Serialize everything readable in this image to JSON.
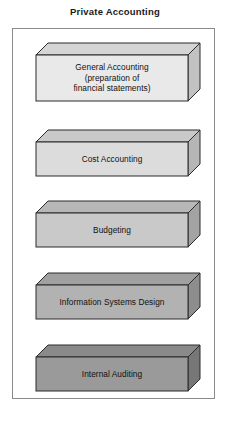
{
  "title": "Private Accounting",
  "frame": {
    "border_color": "#8a8a8a"
  },
  "boxes": [
    {
      "label": "General Accounting\n(preparation of\nfinancial statements)",
      "front_color": "#e9e9e9",
      "top_color": "#d5d5d5",
      "side_color": "#c2c2c2",
      "x": 36,
      "y": 55,
      "w": 152,
      "h": 46,
      "depth": 12
    },
    {
      "label": "Cost Accounting",
      "front_color": "#dcdcdc",
      "top_color": "#c9c9c9",
      "side_color": "#b6b6b6",
      "x": 36,
      "y": 142,
      "w": 152,
      "h": 34,
      "depth": 12
    },
    {
      "label": "Budgeting",
      "front_color": "#c9c9c9",
      "top_color": "#b7b7b7",
      "side_color": "#a3a3a3",
      "x": 36,
      "y": 213,
      "w": 152,
      "h": 34,
      "depth": 12
    },
    {
      "label": "Information Systems Design",
      "front_color": "#b2b2b2",
      "top_color": "#a0a0a0",
      "side_color": "#8d8d8d",
      "x": 36,
      "y": 285,
      "w": 152,
      "h": 34,
      "depth": 12
    },
    {
      "label": "Internal Auditing",
      "front_color": "#9a9a9a",
      "top_color": "#8a8a8a",
      "side_color": "#777777",
      "x": 36,
      "y": 357,
      "w": 152,
      "h": 34,
      "depth": 12
    }
  ],
  "stroke_color": "#2b2b2b"
}
